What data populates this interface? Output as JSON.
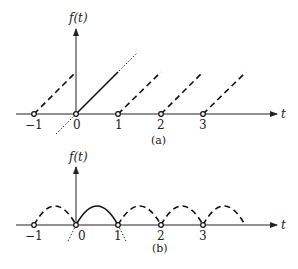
{
  "figure_a": {
    "caption": "(a)",
    "y_label": "f(t)",
    "x_label": "t",
    "ticks": [
      "−1",
      "0",
      "1",
      "2",
      "3"
    ],
    "description": "Periodic sawtooth (ramp) with period 1; solid ramp on [0,1], dashed copies, dotted extension line through origin"
  },
  "figure_b": {
    "caption": "(b)",
    "y_label": "f(t)",
    "x_label": "t",
    "ticks": [
      "−1",
      "0",
      "1",
      "2",
      "3"
    ],
    "description": "Periodic arches with period 1; solid arch on [0,1], dashed copies, dotted extensions at 0 and 1"
  }
}
